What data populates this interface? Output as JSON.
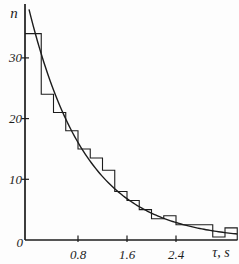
{
  "figure": {
    "background": "#fdfdfd",
    "ink": "#1c1c1c",
    "y_axis": {
      "label": "n",
      "tick_values": [
        10,
        20,
        30
      ],
      "tick_labels": [
        "10",
        "20",
        "30"
      ],
      "max": 39
    },
    "x_axis": {
      "label": "τ, s",
      "tick_values": [
        0.8,
        1.6,
        2.4
      ],
      "tick_labels": [
        "0.8",
        "1.6",
        "2.4"
      ],
      "max": 3.4
    },
    "origin_label": "0"
  },
  "chart_data": {
    "type": "bar",
    "subtype": "histogram-outline-with-fit-curve",
    "title": "",
    "xlabel": "τ, s",
    "ylabel": "n",
    "bin_start": 0,
    "bin_width": 0.2,
    "categories": [
      "0.0-0.2",
      "0.2-0.4",
      "0.4-0.6",
      "0.6-0.8",
      "0.8-1.0",
      "1.0-1.2",
      "1.2-1.4",
      "1.4-1.6",
      "1.6-1.8",
      "1.8-2.0",
      "2.0-2.2",
      "2.2-2.4",
      "2.4-2.6",
      "2.6-2.8",
      "2.8-3.0",
      "3.0-3.2",
      "3.2-3.4"
    ],
    "values": [
      34,
      24,
      21,
      18,
      15,
      13.5,
      11.5,
      8,
      6.5,
      5,
      3.5,
      4,
      2.5,
      2.5,
      2.5,
      0.5,
      2
    ],
    "fit_curve": {
      "type": "exponential",
      "n0": 38,
      "tau0": 0.93
    },
    "xlim": [
      0,
      3.4
    ],
    "ylim": [
      0,
      39
    ],
    "xticks": [
      0.8,
      1.6,
      2.4
    ],
    "yticks": [
      10,
      20,
      30
    ],
    "grid": false,
    "legend": null
  }
}
